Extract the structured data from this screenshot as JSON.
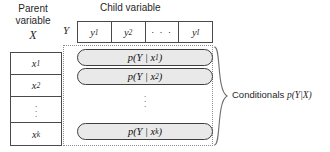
{
  "figure": {
    "parent_header_line1": "Parent",
    "parent_header_line2": "variable",
    "parent_symbol": "X",
    "child_header": "Child variable",
    "y_marker": "Y"
  },
  "child_cells": [
    {
      "base": "y",
      "sub": "1",
      "is_dots": false,
      "text": "y₁"
    },
    {
      "base": "y",
      "sub": "2",
      "is_dots": false,
      "text": "y₂"
    },
    {
      "base": "",
      "sub": "",
      "is_dots": true,
      "text": "· · ·"
    },
    {
      "base": "y",
      "sub": "I",
      "is_dots": false,
      "text": "yⱼ"
    }
  ],
  "parent_cells": [
    {
      "base": "x",
      "sub": "1",
      "is_dots": false,
      "text": "x₁"
    },
    {
      "base": "x",
      "sub": "2",
      "is_dots": false,
      "text": "x₂"
    },
    {
      "base": "",
      "sub": "",
      "is_dots": true,
      "text": "⋮"
    },
    {
      "base": "x",
      "sub": "k",
      "is_dots": false,
      "text": "xₖ"
    }
  ],
  "conditionals": [
    {
      "label": "p(Y | x₁)",
      "prefix": "p(Y | x",
      "sub": "1",
      "suffix": ")"
    },
    {
      "label": "p(Y | x₂)",
      "prefix": "p(Y | x",
      "sub": "2",
      "suffix": ")"
    },
    {
      "label": "p(Y | xₖ)",
      "prefix": "p(Y | x",
      "sub": "k",
      "suffix": ")"
    }
  ],
  "annotation": {
    "text_plain": "Conditionals",
    "math": "p(Y|X)",
    "full": "Conditionals p(Y|X)"
  },
  "colors": {
    "oval_fill": "#e9e9e9",
    "oval_stroke": "#3d3d3d",
    "table_stroke": "#4a4a4a",
    "dotted_stroke": "#8c8c8c",
    "text": "#1f1f1f",
    "background": "#ffffff"
  }
}
